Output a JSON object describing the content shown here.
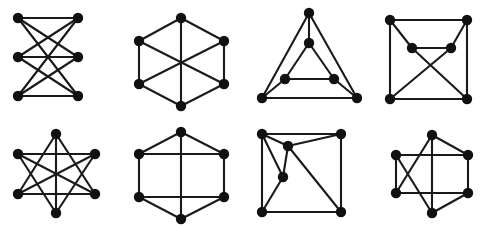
{
  "figure": {
    "background_color": "#ffffff",
    "node_color": "#111111",
    "edge_color": "#1a1a1a",
    "node_radius": 5.2,
    "edge_width": 2.1,
    "width": 488,
    "height": 226,
    "rows": 2,
    "columns": 4,
    "panel_count": 8
  },
  "chart_data": {
    "type": "diagram",
    "subtype": "graph-drawings",
    "grid": false,
    "legend": null,
    "panels": [
      {
        "index": 0,
        "name": "complete-bipartite-crossed",
        "label": "K(3,3) drawn as two vertical columns",
        "vertex_count": 6,
        "edge_count": 9,
        "nodes": [
          {
            "id": "a1",
            "x": 18,
            "y": 18
          },
          {
            "id": "b1",
            "x": 78,
            "y": 18
          },
          {
            "id": "a2",
            "x": 18,
            "y": 57
          },
          {
            "id": "b2",
            "x": 78,
            "y": 57
          },
          {
            "id": "a3",
            "x": 18,
            "y": 96
          },
          {
            "id": "b3",
            "x": 78,
            "y": 96
          }
        ],
        "edges": [
          [
            "a1",
            "b1"
          ],
          [
            "a1",
            "b2"
          ],
          [
            "a1",
            "b3"
          ],
          [
            "a2",
            "b1"
          ],
          [
            "a2",
            "b2"
          ],
          [
            "a2",
            "b3"
          ],
          [
            "a3",
            "b1"
          ],
          [
            "a3",
            "b2"
          ],
          [
            "a3",
            "b3"
          ]
        ]
      },
      {
        "index": 1,
        "name": "hexagon-with-three-diameters",
        "label": "Hexagon with three main diagonals",
        "vertex_count": 6,
        "edge_count": 9,
        "nodes": [
          {
            "id": "h1",
            "x": 181,
            "y": 18
          },
          {
            "id": "h2",
            "x": 224,
            "y": 41
          },
          {
            "id": "h3",
            "x": 224,
            "y": 84
          },
          {
            "id": "h4",
            "x": 181,
            "y": 106
          },
          {
            "id": "h5",
            "x": 139,
            "y": 84
          },
          {
            "id": "h6",
            "x": 139,
            "y": 41
          }
        ],
        "edges": [
          [
            "h1",
            "h2"
          ],
          [
            "h2",
            "h3"
          ],
          [
            "h3",
            "h4"
          ],
          [
            "h4",
            "h5"
          ],
          [
            "h5",
            "h6"
          ],
          [
            "h6",
            "h1"
          ],
          [
            "h1",
            "h4"
          ],
          [
            "h2",
            "h5"
          ],
          [
            "h3",
            "h6"
          ]
        ]
      },
      {
        "index": 2,
        "name": "nested-triangles-prism",
        "label": "Triangular prism drawn as nested triangles",
        "vertex_count": 6,
        "edge_count": 9,
        "nodes": [
          {
            "id": "o1",
            "x": 309,
            "y": 13
          },
          {
            "id": "o2",
            "x": 357,
            "y": 98
          },
          {
            "id": "o3",
            "x": 262,
            "y": 98
          },
          {
            "id": "i1",
            "x": 309,
            "y": 43
          },
          {
            "id": "i2",
            "x": 334,
            "y": 79
          },
          {
            "id": "i3",
            "x": 285,
            "y": 79
          }
        ],
        "edges": [
          [
            "o1",
            "o2"
          ],
          [
            "o2",
            "o3"
          ],
          [
            "o3",
            "o1"
          ],
          [
            "i1",
            "i2"
          ],
          [
            "i2",
            "i3"
          ],
          [
            "i3",
            "i1"
          ],
          [
            "o1",
            "i1"
          ],
          [
            "o2",
            "i2"
          ],
          [
            "o3",
            "i3"
          ]
        ]
      },
      {
        "index": 3,
        "name": "square-with-inner-pair-crossing",
        "label": "Square frame with two inner vertices and crossing chords",
        "vertex_count": 6,
        "edge_count": 9,
        "nodes": [
          {
            "id": "c1",
            "x": 390,
            "y": 20
          },
          {
            "id": "c2",
            "x": 467,
            "y": 20
          },
          {
            "id": "c3",
            "x": 467,
            "y": 99
          },
          {
            "id": "c4",
            "x": 390,
            "y": 99
          },
          {
            "id": "m1",
            "x": 412,
            "y": 48
          },
          {
            "id": "m2",
            "x": 451,
            "y": 48
          }
        ],
        "edges": [
          [
            "c1",
            "c2"
          ],
          [
            "c2",
            "c3"
          ],
          [
            "c3",
            "c4"
          ],
          [
            "c4",
            "c1"
          ],
          [
            "m1",
            "m2"
          ],
          [
            "c1",
            "m1"
          ],
          [
            "c2",
            "m2"
          ],
          [
            "m1",
            "c3"
          ],
          [
            "m2",
            "c4"
          ]
        ]
      },
      {
        "index": 4,
        "name": "hexagram-star",
        "label": "Six-point star on hexagon vertices",
        "vertex_count": 6,
        "edge_count": 9,
        "nodes": [
          {
            "id": "s1",
            "x": 56,
            "y": 134
          },
          {
            "id": "s2",
            "x": 95,
            "y": 154
          },
          {
            "id": "s3",
            "x": 95,
            "y": 194
          },
          {
            "id": "s4",
            "x": 56,
            "y": 213
          },
          {
            "id": "s5",
            "x": 18,
            "y": 194
          },
          {
            "id": "s6",
            "x": 18,
            "y": 154
          }
        ],
        "edges": [
          [
            "s1",
            "s3"
          ],
          [
            "s3",
            "s5"
          ],
          [
            "s5",
            "s1"
          ],
          [
            "s2",
            "s4"
          ],
          [
            "s4",
            "s6"
          ],
          [
            "s6",
            "s2"
          ],
          [
            "s1",
            "s4"
          ],
          [
            "s2",
            "s5"
          ],
          [
            "s3",
            "s6"
          ]
        ]
      },
      {
        "index": 5,
        "name": "hexagon-ladder",
        "label": "Hexagon with vertical diameter and two horizontal chords",
        "vertex_count": 6,
        "edge_count": 9,
        "nodes": [
          {
            "id": "g1",
            "x": 181,
            "y": 132
          },
          {
            "id": "g2",
            "x": 224,
            "y": 154
          },
          {
            "id": "g3",
            "x": 224,
            "y": 197
          },
          {
            "id": "g4",
            "x": 181,
            "y": 219
          },
          {
            "id": "g5",
            "x": 139,
            "y": 197
          },
          {
            "id": "g6",
            "x": 139,
            "y": 154
          }
        ],
        "edges": [
          [
            "g1",
            "g2"
          ],
          [
            "g2",
            "g3"
          ],
          [
            "g3",
            "g4"
          ],
          [
            "g4",
            "g5"
          ],
          [
            "g5",
            "g6"
          ],
          [
            "g6",
            "g1"
          ],
          [
            "g1",
            "g4"
          ],
          [
            "g6",
            "g2"
          ],
          [
            "g5",
            "g3"
          ]
        ]
      },
      {
        "index": 6,
        "name": "square-with-two-interior-vertices",
        "label": "Square with two interior vertices and long diagonal",
        "vertex_count": 6,
        "edge_count": 9,
        "nodes": [
          {
            "id": "q1",
            "x": 262,
            "y": 134
          },
          {
            "id": "q2",
            "x": 341,
            "y": 134
          },
          {
            "id": "q3",
            "x": 341,
            "y": 212
          },
          {
            "id": "q4",
            "x": 262,
            "y": 212
          },
          {
            "id": "p1",
            "x": 288,
            "y": 146
          },
          {
            "id": "p2",
            "x": 283,
            "y": 177
          }
        ],
        "edges": [
          [
            "q1",
            "q2"
          ],
          [
            "q2",
            "q3"
          ],
          [
            "q3",
            "q4"
          ],
          [
            "q4",
            "q1"
          ],
          [
            "q1",
            "p1"
          ],
          [
            "q1",
            "p2"
          ],
          [
            "p1",
            "q2"
          ],
          [
            "p1",
            "p2"
          ],
          [
            "p1",
            "q3"
          ],
          [
            "p2",
            "q4"
          ]
        ]
      },
      {
        "index": 7,
        "name": "prism-with-crossings",
        "label": "Hexagonal arrangement with crossing chords",
        "vertex_count": 6,
        "edge_count": 9,
        "nodes": [
          {
            "id": "r1",
            "x": 432,
            "y": 135
          },
          {
            "id": "r2",
            "x": 468,
            "y": 155
          },
          {
            "id": "r3",
            "x": 468,
            "y": 193
          },
          {
            "id": "r4",
            "x": 432,
            "y": 213
          },
          {
            "id": "r5",
            "x": 396,
            "y": 193
          },
          {
            "id": "r6",
            "x": 396,
            "y": 155
          }
        ],
        "edges": [
          [
            "r1",
            "r2"
          ],
          [
            "r2",
            "r3"
          ],
          [
            "r3",
            "r4"
          ],
          [
            "r5",
            "r6"
          ],
          [
            "r6",
            "r2"
          ],
          [
            "r5",
            "r3"
          ],
          [
            "r1",
            "r4"
          ],
          [
            "r1",
            "r5"
          ],
          [
            "r6",
            "r4"
          ]
        ]
      }
    ]
  }
}
